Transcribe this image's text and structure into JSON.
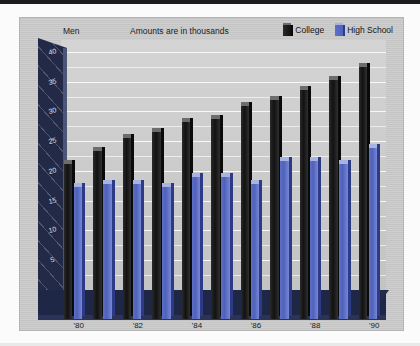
{
  "chart_data": {
    "type": "bar",
    "title": "Men",
    "subtitle": "Amounts are in thousands",
    "xlabel": "",
    "ylabel": "",
    "ylim": [
      0,
      42
    ],
    "yticks": [
      40,
      35,
      30,
      25,
      20,
      15,
      10,
      5
    ],
    "ytick_labels": [
      "40",
      "35",
      "30",
      "25",
      "20",
      "15",
      "10",
      "5"
    ],
    "grid": true,
    "legend_position": "top-right",
    "categories": [
      "1980",
      "1981",
      "1982",
      "1983",
      "1984",
      "1985",
      "1986",
      "1987",
      "1988",
      "1989",
      "1990"
    ],
    "xtick_labels": [
      "'80",
      "'82",
      "'84",
      "'86",
      "'88",
      "'90"
    ],
    "xtick_categories": [
      "1980",
      "1982",
      "1984",
      "1986",
      "1988",
      "1990"
    ],
    "series": [
      {
        "name": "College",
        "color": "#1a1a1a",
        "values": [
          24.5,
          26.5,
          28.5,
          29.5,
          31.0,
          31.5,
          33.5,
          34.5,
          36.0,
          37.5,
          39.5
        ]
      },
      {
        "name": "High School",
        "color": "#5062bd",
        "values": [
          21.0,
          21.5,
          21.5,
          21.0,
          22.5,
          22.5,
          21.5,
          25.0,
          25.0,
          24.5,
          27.0
        ]
      }
    ]
  },
  "legend": {
    "items": [
      {
        "label": "College",
        "swatch": "college"
      },
      {
        "label": "High School",
        "swatch": "hs"
      }
    ]
  },
  "labels": {
    "men": "Men",
    "subtitle": "Amounts are in thousands"
  }
}
